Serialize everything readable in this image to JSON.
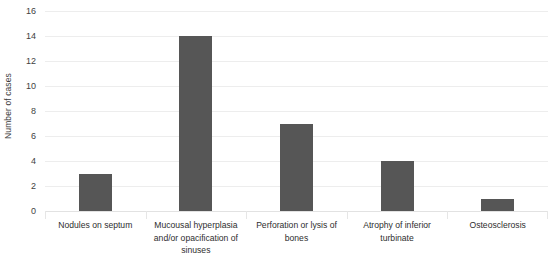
{
  "chart_data": {
    "type": "bar",
    "title": "",
    "subtitle": "",
    "xlabel": "",
    "ylabel": "Number of cases",
    "categories": [
      "Nodules on septum",
      "Mucousal hyperplasia and/or opacification of sinuses",
      "Perforation or lysis of bones",
      "Atrophy of inferior turbinate",
      "Osteosclerosis"
    ],
    "values": [
      3,
      14,
      7,
      4,
      1
    ],
    "ylim": [
      0,
      16
    ],
    "ytick_step": 2,
    "yticks": [
      0,
      2,
      4,
      6,
      8,
      10,
      12,
      14,
      16
    ],
    "ytick_labels": [
      "0",
      "2",
      "4",
      "6",
      "8",
      "10",
      "12",
      "14",
      "16"
    ],
    "grid": true,
    "grid_axis": "y",
    "legend": false,
    "legend_position": "none",
    "bar_color": "#565656",
    "gridline_color": "#ededed",
    "background_color": "#ffffff",
    "axis_text_color": "#3f3f3f"
  }
}
